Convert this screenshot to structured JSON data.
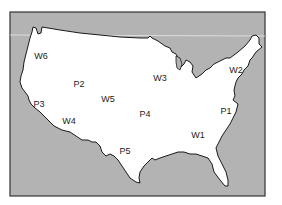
{
  "map": {
    "subject": "Contiguous United States outline",
    "colors": {
      "water": "#b3b3b3",
      "land": "#ffffff",
      "coastline": "#1a1a1a",
      "frame_border": "#333333",
      "label": "#222222"
    },
    "labels": [
      {
        "id": "W6",
        "text": "W6",
        "x": 41,
        "y": 56
      },
      {
        "id": "P2",
        "text": "P2",
        "x": 79,
        "y": 84
      },
      {
        "id": "W3",
        "text": "W3",
        "x": 160,
        "y": 78
      },
      {
        "id": "W2",
        "text": "W2",
        "x": 236,
        "y": 70
      },
      {
        "id": "P3",
        "text": "P3",
        "x": 39,
        "y": 104
      },
      {
        "id": "W5",
        "text": "W5",
        "x": 108,
        "y": 99
      },
      {
        "id": "P4",
        "text": "P4",
        "x": 145,
        "y": 114
      },
      {
        "id": "P1",
        "text": "P1",
        "x": 226,
        "y": 111
      },
      {
        "id": "W4",
        "text": "W4",
        "x": 69,
        "y": 121
      },
      {
        "id": "W1",
        "text": "W1",
        "x": 198,
        "y": 135
      },
      {
        "id": "P5",
        "text": "P5",
        "x": 125,
        "y": 151
      }
    ]
  }
}
